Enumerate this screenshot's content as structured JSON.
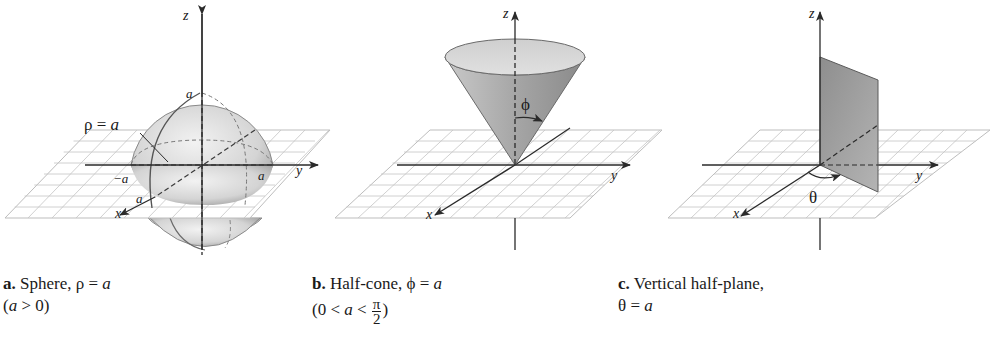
{
  "panels": [
    {
      "id": "a",
      "name": "sphere",
      "caption_letter": "a.",
      "caption_title": "Sphere, ρ = ",
      "caption_var": "a",
      "caption_line2_open": "(",
      "caption_line2_var": "a",
      "caption_line2_rest": " > 0)",
      "surface_label_sym": "ρ = ",
      "surface_label_var": "a",
      "axis_labels": {
        "z": "z",
        "y": "y",
        "x": "x"
      },
      "tick_labels": {
        "top": "a",
        "neg_y": "−a",
        "pos_y": "a",
        "pos_x": "a"
      }
    },
    {
      "id": "b",
      "name": "half-cone",
      "caption_letter": "b.",
      "caption_title": "Half-cone, ϕ = ",
      "caption_var": "a",
      "caption_line2_open": "(0 < ",
      "caption_line2_var": "a",
      "caption_line2_rest": " < ",
      "caption_frac_num": "π",
      "caption_frac_den": "2",
      "caption_line2_close": ")",
      "angle_label": "ϕ",
      "axis_labels": {
        "z": "z",
        "y": "y",
        "x": "x"
      }
    },
    {
      "id": "c",
      "name": "vertical-half-plane",
      "caption_letter": "c.",
      "caption_title": "Vertical half-plane,",
      "caption_line2_sym": "θ = ",
      "caption_line2_var": "a",
      "angle_label": "θ",
      "axis_labels": {
        "z": "z",
        "y": "y",
        "x": "x"
      }
    }
  ],
  "colors": {
    "axis": "#2a2a2a",
    "grid": "#b8b8b8",
    "grid_fill": "#ffffff",
    "surface_light": "#e6e6e6",
    "surface_dark": "#9a9a9a",
    "plane_fill": "#a8a8a8"
  }
}
